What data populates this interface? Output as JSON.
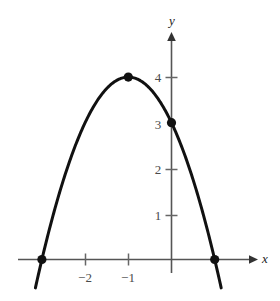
{
  "chart_data": {
    "type": "line",
    "title": "",
    "subtitle": "",
    "xlabel": "x",
    "ylabel": "y",
    "grid": false,
    "legend": "none",
    "curve": {
      "name": "parabola",
      "equation": "y = -(x + 1)^2 + 4",
      "orientation": "opens-downward",
      "color": "#111111",
      "line_width": 3,
      "x": [
        -3.15,
        -3.0,
        -2.75,
        -2.5,
        -2.25,
        -2.0,
        -1.75,
        -1.5,
        -1.25,
        -1.0,
        -0.75,
        -0.5,
        -0.25,
        0.0,
        0.25,
        0.5,
        0.75,
        1.0,
        1.15
      ],
      "y": [
        -0.62,
        0.0,
        0.94,
        1.75,
        2.44,
        3.0,
        3.44,
        3.75,
        3.94,
        4.0,
        3.94,
        3.75,
        3.44,
        3.0,
        2.44,
        1.75,
        0.94,
        0.0,
        -0.62
      ]
    },
    "points": [
      {
        "label": "left-root",
        "x": -3,
        "y": 0,
        "marker": "filled-circle",
        "color": "#111111"
      },
      {
        "label": "vertex",
        "x": -1,
        "y": 4,
        "marker": "filled-circle",
        "color": "#111111"
      },
      {
        "label": "y-intercept",
        "x": 0,
        "y": 3,
        "marker": "filled-circle",
        "color": "#111111"
      },
      {
        "label": "right-root",
        "x": 1,
        "y": 0,
        "marker": "filled-circle",
        "color": "#111111"
      }
    ],
    "x_ticks": [
      {
        "value": -2,
        "label": "−2"
      },
      {
        "value": -1,
        "label": "−1"
      }
    ],
    "y_ticks": [
      {
        "value": 1,
        "label": "1"
      },
      {
        "value": 2,
        "label": "2"
      },
      {
        "value": 3,
        "label": "3"
      },
      {
        "value": 4,
        "label": "4"
      }
    ],
    "xlim": [
      -3.55,
      1.9
    ],
    "ylim": [
      -0.72,
      4.9
    ],
    "axis_color": "#555555",
    "axis_arrow_color": "#333333"
  },
  "labels": {
    "x_axis": "x",
    "y_axis": "y",
    "x_tick_minus2": "−2",
    "x_tick_minus1": "−1",
    "y_tick_1": "1",
    "y_tick_2": "2",
    "y_tick_3": "3",
    "y_tick_4": "4"
  }
}
